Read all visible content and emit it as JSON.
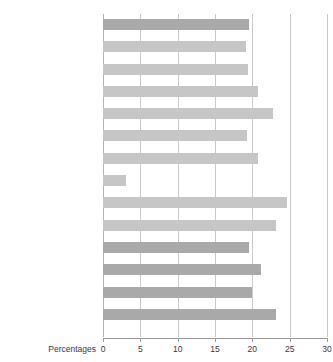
{
  "chart_data": {
    "type": "bar",
    "orientation": "horizontal",
    "title": "between 1998 and 2002",
    "xlabel": "Percentages",
    "ylabel": "",
    "xlim": [
      0,
      30
    ],
    "xticks": [
      0,
      5,
      10,
      15,
      20,
      25,
      30
    ],
    "grid": true,
    "legend": null,
    "categories": [
      "Great Britain",
      "North East",
      "North West",
      "Yorkshire and the Humber",
      "East Midlands",
      "West Midlands",
      "East",
      "London",
      "South East",
      "South West",
      "England",
      "Wales",
      "Scotland",
      "Northern Ireland"
    ],
    "category_labels": [
      "Great Britain",
      "North East",
      "North West",
      "Yorkshire and the Humber",
      "East Midlands",
      "West Midlands",
      "East",
      "London",
      "South East",
      "South West",
      "England",
      "Wales",
      "Scotland",
      "Northern Ireland"
    ],
    "category_footnotes": [
      "",
      "",
      "",
      "",
      "",
      "",
      "",
      "",
      "",
      "",
      "",
      "",
      "",
      "1"
    ],
    "emphasis": [
      true,
      false,
      false,
      false,
      false,
      false,
      false,
      false,
      false,
      false,
      true,
      true,
      true,
      true
    ],
    "values": [
      19.6,
      19.2,
      19.4,
      20.7,
      22.8,
      19.3,
      20.7,
      3.1,
      24.7,
      23.2,
      19.5,
      21.1,
      19.9,
      23.2
    ],
    "bar_color": "#c6c6c6",
    "bar_color_emphasis": "#a9a9a9",
    "gridline_color": "#c9c9c9",
    "axis_color": "#9b9b9b"
  }
}
